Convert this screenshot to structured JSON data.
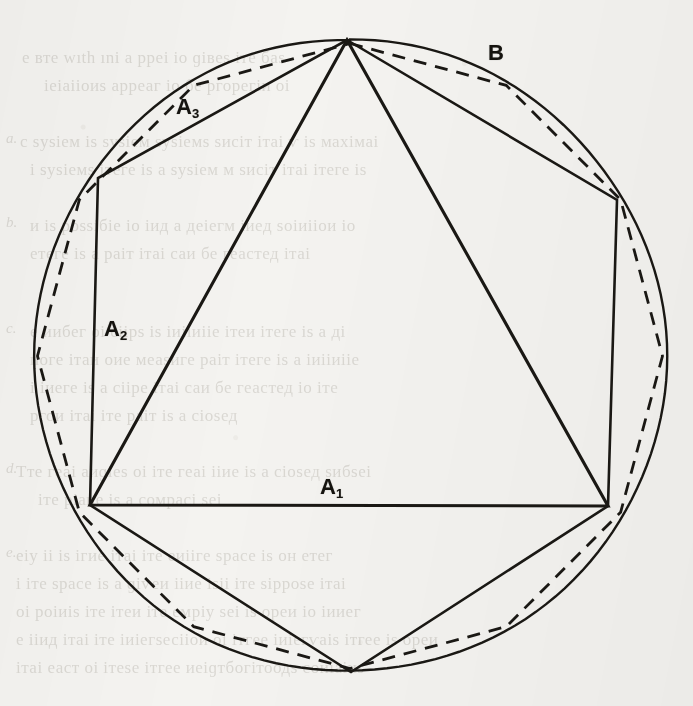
{
  "figure": {
    "background_color": "#f4f3f0",
    "ink_color": "#1a1814",
    "labels": [
      {
        "id": "A1",
        "base": "A",
        "sub": "1",
        "text": "A₁",
        "x": 320,
        "y": 476,
        "meaning": "inscribed-equilateral-triangle-side"
      },
      {
        "id": "A2",
        "base": "A",
        "sub": "2",
        "text": "A₂",
        "x": 104,
        "y": 318,
        "meaning": "inscribed-regular-hexagon-side"
      },
      {
        "id": "A3",
        "base": "A",
        "sub": "3",
        "text": "A₃",
        "x": 176,
        "y": 96,
        "meaning": "inscribed-regular-hexagon-side-upper-left"
      },
      {
        "id": "B",
        "base": "B",
        "sub": "",
        "text": "B",
        "x": 488,
        "y": 42,
        "meaning": "inscribed-regular-dodecagon-arc-region"
      }
    ],
    "circle": {
      "cx": 350,
      "cy": 356,
      "r": 316,
      "stroke": "#1a1814",
      "stroke_width": 2.4,
      "style": "solid"
    },
    "triangle": {
      "name": "inscribed-equilateral-triangle",
      "style": "solid",
      "stroke_width": 3.1,
      "vertices": [
        [
          347,
          40
        ],
        [
          90,
          505
        ],
        [
          608,
          506
        ]
      ]
    },
    "hexagon": {
      "name": "inscribed-regular-hexagon",
      "style": "solid",
      "stroke_width": 2.6,
      "vertices": [
        [
          347,
          40
        ],
        [
          617,
          200
        ],
        [
          608,
          506
        ],
        [
          351,
          672
        ],
        [
          90,
          505
        ],
        [
          98,
          178
        ]
      ]
    },
    "dodecagon": {
      "name": "inscribed-regular-dodecagon",
      "style": "dashed",
      "stroke_width": 2.8,
      "dash_pattern": "13 9",
      "vertex_count": 12
    }
  },
  "ghost_text": {
    "note": "faint bleed-through text from reverse side of page",
    "lines": [
      {
        "text": "е вте  wıth   ınі  а рреі  іо  ɡівеѕ іте баѕ",
        "x": 22,
        "y": 48
      },
      {
        "text": "іеіаііоиѕ арреаг іо бе ргорегіи оі",
        "x": 44,
        "y": 76
      },
      {
        "text": "с ѕуѕіем іѕ ѕуѕіем ѕуѕіемѕ ѕисіт ітаі ѵ іѕ махімаі",
        "x": 20,
        "y": 132
      },
      {
        "text": "і ѕуѕіемѕ ітеге іѕ а ѕуѕіем м ѕисіт ітаі ітеге іѕ",
        "x": 30,
        "y": 160
      },
      {
        "text": "и іѕ роѕѕібіе іо іид а деіегм іиед ѕоіиііои іо",
        "x": 30,
        "y": 216
      },
      {
        "text": "етеге іѕ а раіт ітаі саи бе геастед ітаі",
        "x": 30,
        "y": 244
      },
      {
        "text": "е иибег оі сіірѕ іѕ іиііиііе ітеи ітеге іѕ а ді",
        "x": 30,
        "y": 322
      },
      {
        "text": "иоге ітаи оие меаѕиге раіт ітеге іѕ а іиііиііе",
        "x": 30,
        "y": 350
      },
      {
        "text": "і іиеге іѕ а сііре ітаі саи бе геастед іо іте",
        "x": 30,
        "y": 378
      },
      {
        "text": "ргои ітаі іте раіт іѕ а сіоѕед",
        "x": 30,
        "y": 406
      },
      {
        "text": "Тте геаі аиɡіеѕ оі іте геаі ііие іѕ а сіоѕед ѕибѕеі",
        "x": 16,
        "y": 462
      },
      {
        "text": "іте ріаие іѕ а сомрасі ѕеі",
        "x": 38,
        "y": 490
      },
      {
        "text": "еіу іі іѕ ігие ітаі іте еиііге ѕрасе іѕ он етег",
        "x": 16,
        "y": 546
      },
      {
        "text": "і іте ѕрасе іѕ а ɡіѵеи ііие іѕіі іте ѕірроѕе ітаі",
        "x": 16,
        "y": 574
      },
      {
        "text": "оі роіиіѕ іте ітеи іте емріу ѕеі іѕ ореи іо іииег",
        "x": 16,
        "y": 602
      },
      {
        "text": "е ііид ітаі іте іиіегѕесііои оі ітгее іиіегѵаіѕ ітгее іѕ ореи",
        "x": 16,
        "y": 630
      },
      {
        "text": "ітаі еаст оі ітеѕе ітгее иеіɡтбогітоодѕ соиіаіиѕ",
        "x": 16,
        "y": 658
      }
    ],
    "margin_marks": [
      {
        "text": "a.",
        "x": 6,
        "y": 130
      },
      {
        "text": "b.",
        "x": 6,
        "y": 214
      },
      {
        "text": "c.",
        "x": 6,
        "y": 320
      },
      {
        "text": "d.",
        "x": 6,
        "y": 460
      },
      {
        "text": "e.",
        "x": 6,
        "y": 544
      }
    ]
  }
}
